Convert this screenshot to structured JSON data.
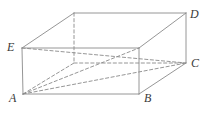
{
  "figure": {
    "kind": "geometry-diagram",
    "shape_name": "rectangular box",
    "projection": "oblique",
    "stroke_color": "#8a8a8a",
    "dashed_stroke_color": "#8a8a8a",
    "label_color": "#3a3a3a",
    "background_color": "#ffffff",
    "labels": [
      {
        "text": "E",
        "x": 7,
        "y": 41
      },
      {
        "text": "D",
        "x": 190,
        "y": 8
      },
      {
        "text": "C",
        "x": 191,
        "y": 57
      },
      {
        "text": "A",
        "x": 9,
        "y": 92
      },
      {
        "text": "B",
        "x": 144,
        "y": 92
      }
    ],
    "vertices": {
      "A": {
        "x": 23,
        "y": 94
      },
      "B": {
        "x": 139,
        "y": 94
      },
      "C": {
        "x": 186,
        "y": 63
      },
      "D": {
        "x": 186,
        "y": 13
      },
      "E": {
        "x": 22,
        "y": 48
      },
      "front_top_right": {
        "x": 139,
        "y": 48
      },
      "back_top_left": {
        "x": 74,
        "y": 13
      },
      "back_bottom_left": {
        "x": 74,
        "y": 63
      }
    },
    "solid_edges": [
      {
        "name": "front-top-edge",
        "x1": 22,
        "y1": 48,
        "x2": 139,
        "y2": 48
      },
      {
        "name": "front-right-edge",
        "x1": 139,
        "y1": 48,
        "x2": 139,
        "y2": 94
      },
      {
        "name": "front-bottom-edge",
        "x1": 23,
        "y1": 94,
        "x2": 139,
        "y2": 94
      },
      {
        "name": "front-left-edge",
        "x1": 22,
        "y1": 48,
        "x2": 23,
        "y2": 94
      },
      {
        "name": "top-back-edge",
        "x1": 74,
        "y1": 13,
        "x2": 186,
        "y2": 13
      },
      {
        "name": "back-right-edge",
        "x1": 186,
        "y1": 13,
        "x2": 186,
        "y2": 63
      },
      {
        "name": "top-left-slant-edge",
        "x1": 22,
        "y1": 48,
        "x2": 74,
        "y2": 13
      },
      {
        "name": "top-right-slant-edge",
        "x1": 139,
        "y1": 48,
        "x2": 186,
        "y2": 13
      },
      {
        "name": "bottom-right-slant-edge",
        "x1": 139,
        "y1": 94,
        "x2": 186,
        "y2": 63
      }
    ],
    "dashed_edges": [
      {
        "name": "hidden-back-vertical-edge",
        "x1": 74,
        "y1": 13,
        "x2": 74,
        "y2": 63
      },
      {
        "name": "hidden-back-bottom-edge",
        "x1": 74,
        "y1": 63,
        "x2": 186,
        "y2": 63
      },
      {
        "name": "hidden-left-slant-edge",
        "x1": 23,
        "y1": 94,
        "x2": 74,
        "y2": 63
      },
      {
        "name": "hidden-top-face-diagonal",
        "x1": 22,
        "y1": 48,
        "x2": 186,
        "y2": 63
      },
      {
        "name": "diagonal-A-to-C",
        "x1": 23,
        "y1": 94,
        "x2": 186,
        "y2": 63
      },
      {
        "name": "hidden-base-diagonal",
        "x1": 23,
        "y1": 94,
        "x2": 139,
        "y2": 48
      }
    ]
  }
}
